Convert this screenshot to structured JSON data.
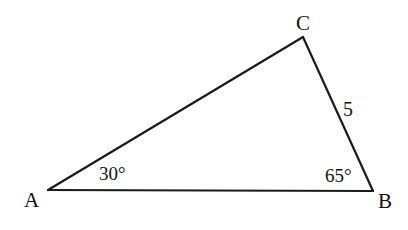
{
  "diagram": {
    "type": "triangle",
    "vertices": {
      "A": {
        "label": "A",
        "x": 48,
        "y": 190
      },
      "B": {
        "label": "B",
        "x": 373,
        "y": 191
      },
      "C": {
        "label": "C",
        "x": 303,
        "y": 37
      }
    },
    "angles": {
      "A": "30°",
      "B": "65°"
    },
    "sides": {
      "BC": "5"
    },
    "colors": {
      "stroke": "#1a1a1a",
      "background": "#ffffff"
    }
  }
}
